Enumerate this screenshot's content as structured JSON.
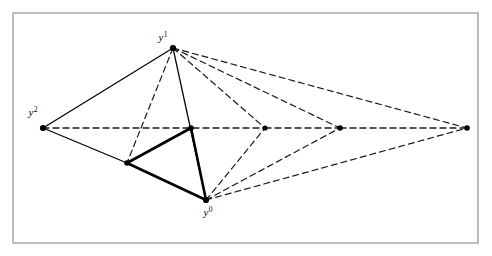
{
  "figure": {
    "title": "",
    "frame": {
      "x": 13,
      "y": 13,
      "width": 465,
      "height": 230,
      "stroke_color": "#9a9a9a",
      "stroke_width": 1.3,
      "fill_color": "#ffffff"
    },
    "colors": {
      "solid_line": "#000000",
      "dashed_line": "#1a1a1a",
      "thick_line": "#000000",
      "vertex_dot": "#000000",
      "background": "#ffffff",
      "label_text": "#000000"
    },
    "labels": [
      {
        "id": "label-y1",
        "base": "y",
        "sup": "1",
        "x": 163,
        "y": 41,
        "anchor": "middle"
      },
      {
        "id": "label-y2",
        "base": "y",
        "sup": "2",
        "x": 33,
        "y": 116,
        "anchor": "middle"
      },
      {
        "id": "label-y0",
        "base": "y",
        "sup": "0",
        "x": 208,
        "y": 216,
        "anchor": "middle"
      }
    ],
    "vertices": [
      {
        "id": "y1",
        "label": "y1",
        "x": 173,
        "y": 48,
        "r": 3.1,
        "dot": true
      },
      {
        "id": "y2",
        "label": "y2",
        "x": 43,
        "y": 128,
        "r": 3.1,
        "dot": true
      },
      {
        "id": "y0",
        "label": "y0",
        "x": 206,
        "y": 200,
        "r": 3.1,
        "dot": true
      },
      {
        "id": "p1",
        "label": "",
        "x": 191,
        "y": 128,
        "r": 2.8,
        "dot": true
      },
      {
        "id": "p2",
        "label": "",
        "x": 127,
        "y": 163,
        "r": 2.8,
        "dot": true
      },
      {
        "id": "p3",
        "label": "",
        "x": 265,
        "y": 128,
        "r": 2.6,
        "dot": true
      },
      {
        "id": "p4",
        "label": "",
        "x": 340,
        "y": 128,
        "r": 2.8,
        "dot": true
      },
      {
        "id": "p5",
        "label": "",
        "x": 467,
        "y": 128,
        "r": 2.8,
        "dot": true
      }
    ],
    "edges": [
      {
        "id": "e-y2-y1",
        "from": "y2",
        "to": "y1",
        "style": "solid",
        "width": 1.25
      },
      {
        "id": "e-y1-y0",
        "from": "y1",
        "to": "y0",
        "style": "solid",
        "width": 1.25
      },
      {
        "id": "e-y2-p2",
        "from": "y2",
        "to": "p2",
        "style": "solid",
        "width": 1.25
      },
      {
        "id": "e-y2-p3",
        "from": "y2",
        "to": "p3",
        "style": "dashed",
        "width": 1.3
      },
      {
        "id": "e-p3-p4",
        "from": "p3",
        "to": "p4",
        "style": "dashed",
        "width": 1.3
      },
      {
        "id": "e-p4-p5",
        "from": "p4",
        "to": "p5",
        "style": "dashed",
        "width": 1.3
      },
      {
        "id": "e-y1-p2",
        "from": "y1",
        "to": "p2",
        "style": "dashed",
        "width": 1.2
      },
      {
        "id": "e-y1-y0-dash",
        "from": "y1",
        "to": "y0",
        "style": "none",
        "width": 0
      },
      {
        "id": "e-y1-p3",
        "from": "y1",
        "to": "p3",
        "style": "dashed",
        "width": 1.2
      },
      {
        "id": "e-y1-p4",
        "from": "y1",
        "to": "p4",
        "style": "dashed",
        "width": 1.2
      },
      {
        "id": "e-y1-p5",
        "from": "y1",
        "to": "p5",
        "style": "dashed",
        "width": 1.2
      },
      {
        "id": "e-y0-p2",
        "from": "y0",
        "to": "p2",
        "style": "dashed",
        "width": 1.2
      },
      {
        "id": "e-y0-p3",
        "from": "y0",
        "to": "p3",
        "style": "dashed",
        "width": 1.2
      },
      {
        "id": "e-y0-p4",
        "from": "y0",
        "to": "p4",
        "style": "dashed",
        "width": 1.2
      },
      {
        "id": "e-y0-p5",
        "from": "y0",
        "to": "p5",
        "style": "dashed",
        "width": 1.2
      },
      {
        "id": "e-thick-p1-p2",
        "from": "p1",
        "to": "p2",
        "style": "solid",
        "width": 2.6
      },
      {
        "id": "e-thick-p2-y0",
        "from": "p2",
        "to": "y0",
        "style": "solid",
        "width": 2.6
      },
      {
        "id": "e-thick-y0-p1",
        "from": "y0",
        "to": "p1",
        "style": "solid",
        "width": 2.6
      }
    ],
    "dash_pattern": "6,4"
  }
}
